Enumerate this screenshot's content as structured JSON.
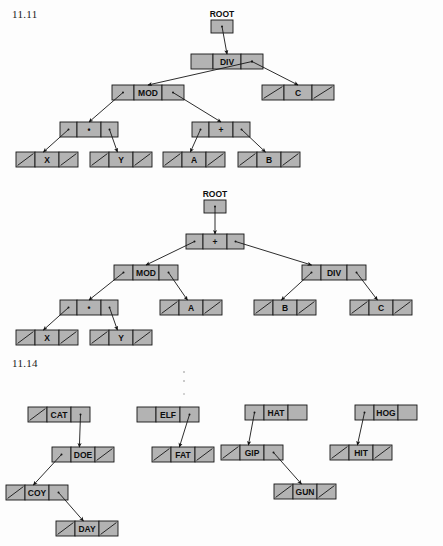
{
  "page": {
    "width": 443,
    "height": 546,
    "background": "#ffffff",
    "node_fill": "#b3b3b3",
    "stroke": "#151515"
  },
  "figures": [
    {
      "id": "fig-11-11",
      "label": "11.11",
      "caption_position": {
        "x": 12,
        "y": 8
      },
      "trees": [
        {
          "id": "tree-div",
          "root_pointer_label": "ROOT",
          "expression": "(X * Y) MOD (A + B) DIV C",
          "nodes": [
            {
              "id": "n-div",
              "label": "DIV",
              "left": "ptr",
              "right": "ptr",
              "x": 191,
              "y": 54,
              "w": 72
            },
            {
              "id": "n-mod",
              "label": "MOD",
              "left": "ptr",
              "right": "ptr",
              "x": 112,
              "y": 85,
              "w": 72
            },
            {
              "id": "n-c",
              "label": "C",
              "left": "null",
              "right": "null",
              "x": 262,
              "y": 85,
              "w": 72
            },
            {
              "id": "n-mul",
              "label": "•",
              "left": "ptr",
              "right": "ptr",
              "x": 60,
              "y": 122,
              "w": 58
            },
            {
              "id": "n-plus",
              "label": "+",
              "left": "ptr",
              "right": "ptr",
              "x": 192,
              "y": 122,
              "w": 58
            },
            {
              "id": "n-x",
              "label": "X",
              "left": "null",
              "right": "null",
              "x": 16,
              "y": 152,
              "w": 62
            },
            {
              "id": "n-y",
              "label": "Y",
              "left": "null",
              "right": "null",
              "x": 90,
              "y": 152,
              "w": 62
            },
            {
              "id": "n-a",
              "label": "A",
              "left": "null",
              "right": "null",
              "x": 163,
              "y": 152,
              "w": 62
            },
            {
              "id": "n-b",
              "label": "B",
              "left": "null",
              "right": "null",
              "x": 238,
              "y": 152,
              "w": 62
            }
          ]
        },
        {
          "id": "tree-plus",
          "root_pointer_label": "ROOT",
          "expression": "((X * Y) MOD A) + (B DIV C)",
          "nodes": [
            {
              "id": "m-plus",
              "label": "+",
              "left": "ptr",
              "right": "ptr",
              "x": 186,
              "y": 234,
              "w": 58
            },
            {
              "id": "m-mod",
              "label": "MOD",
              "left": "ptr",
              "right": "ptr",
              "x": 114,
              "y": 265,
              "w": 64
            },
            {
              "id": "m-div",
              "label": "DIV",
              "left": "ptr",
              "right": "ptr",
              "x": 302,
              "y": 265,
              "w": 64
            },
            {
              "id": "m-mul",
              "label": "•",
              "left": "ptr",
              "right": "ptr",
              "x": 60,
              "y": 300,
              "w": 58
            },
            {
              "id": "m-a",
              "label": "A",
              "left": "null",
              "right": "null",
              "x": 160,
              "y": 300,
              "w": 62
            },
            {
              "id": "m-b",
              "label": "B",
              "left": "null",
              "right": "null",
              "x": 254,
              "y": 300,
              "w": 62
            },
            {
              "id": "m-c",
              "label": "C",
              "left": "null",
              "right": "null",
              "x": 350,
              "y": 300,
              "w": 62
            },
            {
              "id": "m-x",
              "label": "X",
              "left": "null",
              "right": "null",
              "x": 16,
              "y": 330,
              "w": 62
            },
            {
              "id": "m-y",
              "label": "Y",
              "left": "null",
              "right": "null",
              "x": 90,
              "y": 330,
              "w": 62
            }
          ]
        }
      ]
    },
    {
      "id": "fig-11-14",
      "label": "11.14",
      "caption_position": {
        "x": 12,
        "y": 357
      },
      "trees": [
        {
          "id": "tree-cat",
          "nodes": [
            {
              "id": "k-cat",
              "label": "CAT",
              "left": "null",
              "right": "ptr",
              "x": 28,
              "y": 407,
              "w": 62
            },
            {
              "id": "k-doe",
              "label": "DOE",
              "left": "ptr",
              "right": "null",
              "x": 52,
              "y": 447,
              "w": 62
            },
            {
              "id": "k-coy",
              "label": "COY",
              "left": "null",
              "right": "ptr",
              "x": 6,
              "y": 485,
              "w": 62
            },
            {
              "id": "k-day",
              "label": "DAY",
              "left": "null",
              "right": "null",
              "x": 56,
              "y": 521,
              "w": 62
            }
          ]
        },
        {
          "id": "tree-elf",
          "nodes": [
            {
              "id": "k-elf",
              "label": "ELF",
              "left": "blank",
              "right": "ptr",
              "x": 137,
              "y": 407,
              "w": 62
            },
            {
              "id": "k-fat",
              "label": "FAT",
              "left": "null",
              "right": "null",
              "x": 152,
              "y": 447,
              "w": 62
            }
          ]
        },
        {
          "id": "tree-hat",
          "nodes": [
            {
              "id": "k-hat",
              "label": "HAT",
              "left": "ptr",
              "right": "blank",
              "x": 245,
              "y": 405,
              "w": 62
            },
            {
              "id": "k-gip",
              "label": "GIP",
              "left": "null",
              "right": "ptr",
              "x": 221,
              "y": 445,
              "w": 62
            },
            {
              "id": "k-gun",
              "label": "GUN",
              "left": "null",
              "right": "null",
              "x": 274,
              "y": 484,
              "w": 62
            }
          ]
        },
        {
          "id": "tree-hog",
          "nodes": [
            {
              "id": "k-hog",
              "label": "HOG",
              "left": "ptr",
              "right": "blank",
              "x": 355,
              "y": 405,
              "w": 62
            },
            {
              "id": "k-hit",
              "label": "HIT",
              "left": "null",
              "right": "null",
              "x": 330,
              "y": 445,
              "w": 62
            }
          ]
        }
      ]
    }
  ],
  "annotations": {
    "root_labels": [
      "ROOT",
      "ROOT"
    ],
    "node_text_values": [
      "DIV",
      "MOD",
      "C",
      "•",
      "+",
      "X",
      "Y",
      "A",
      "B",
      "+",
      "MOD",
      "DIV",
      "•",
      "A",
      "B",
      "C",
      "X",
      "Y",
      "CAT",
      "DOE",
      "COY",
      "DAY",
      "ELF",
      "FAT",
      "HAT",
      "GIP",
      "GUN",
      "HOG",
      "HIT"
    ]
  }
}
